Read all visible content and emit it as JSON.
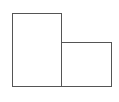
{
  "diagram": {
    "shapes": [
      {
        "id": "box-left",
        "type": "rectangle",
        "fill": "#ffffff",
        "stroke": "#555555"
      },
      {
        "id": "box-right",
        "type": "rectangle",
        "fill": "#ffffff",
        "stroke": "#555555"
      }
    ]
  }
}
